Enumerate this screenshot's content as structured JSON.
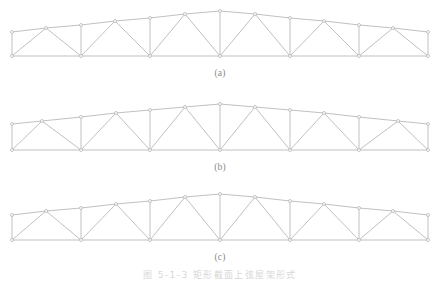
{
  "page": {
    "background_color": "#ffffff",
    "line_color": "#b9b9b9",
    "node_color": "#ffffff",
    "node_stroke_color": "#b0b0b0",
    "text_color": "#8a8a8a"
  },
  "figure": {
    "caption": "图 5-1-3  矩形截面上弦屋架形式",
    "caption_visible_fragment": "图 5-1-3  矩形截面上弦屋架形式",
    "subfigures": [
      {
        "id": "a",
        "label": "(a)",
        "description": "Low-pitch trapezoidal truss with 12 bottom-chord panels and alternating-direction web diagonals"
      },
      {
        "id": "b",
        "label": "(b)",
        "description": "Low-pitch truss with 8 bottom-chord panels, vertical posts at panel points and sloping web diagonals"
      },
      {
        "id": "c",
        "label": "(c)",
        "description": "Low-pitch truss with 8 bottom-chord panels, mirrored diagonal arrangement"
      }
    ]
  },
  "geometry": {
    "viewbox": {
      "width": 440,
      "height": 62
    },
    "truss_a": {
      "bottom_chord_y": 52,
      "eave_y": 28,
      "apex_y": 7,
      "left_x": 12,
      "right_x": 428,
      "bottom_nodes_x": [
        12,
        81,
        150,
        220,
        290,
        359,
        428
      ],
      "top_nodes": [
        [
          12,
          28
        ],
        [
          46,
          24
        ],
        [
          81,
          21
        ],
        [
          115,
          17
        ],
        [
          150,
          14
        ],
        [
          185,
          10
        ],
        [
          220,
          7
        ],
        [
          255,
          10
        ],
        [
          290,
          14
        ],
        [
          324,
          17
        ],
        [
          359,
          21
        ],
        [
          393,
          24
        ],
        [
          428,
          28
        ]
      ],
      "verticals": [
        [
          12,
          28,
          12,
          52
        ],
        [
          81,
          21,
          81,
          52
        ],
        [
          150,
          14,
          150,
          52
        ],
        [
          220,
          7,
          220,
          52
        ],
        [
          290,
          14,
          290,
          52
        ],
        [
          359,
          21,
          359,
          52
        ],
        [
          428,
          28,
          428,
          52
        ]
      ],
      "diagonals": [
        [
          12,
          52,
          46,
          24
        ],
        [
          46,
          24,
          81,
          52
        ],
        [
          81,
          52,
          115,
          17
        ],
        [
          115,
          17,
          150,
          52
        ],
        [
          150,
          52,
          185,
          10
        ],
        [
          185,
          10,
          220,
          52
        ],
        [
          220,
          52,
          255,
          10
        ],
        [
          255,
          10,
          290,
          52
        ],
        [
          290,
          52,
          324,
          17
        ],
        [
          324,
          17,
          359,
          52
        ],
        [
          359,
          52,
          393,
          24
        ],
        [
          393,
          24,
          428,
          52
        ]
      ]
    },
    "truss_b": {
      "bottom_chord_y": 52,
      "eave_y": 26,
      "apex_y": 6,
      "left_x": 12,
      "right_x": 428,
      "bottom_nodes_x": [
        12,
        81,
        150,
        220,
        290,
        359,
        428
      ],
      "top_nodes": [
        [
          12,
          26
        ],
        [
          42,
          23
        ],
        [
          81,
          19
        ],
        [
          116,
          15
        ],
        [
          150,
          12
        ],
        [
          185,
          9
        ],
        [
          220,
          6
        ],
        [
          255,
          9
        ],
        [
          290,
          12
        ],
        [
          324,
          15
        ],
        [
          359,
          19
        ],
        [
          398,
          23
        ],
        [
          428,
          26
        ]
      ],
      "verticals": [
        [
          12,
          26,
          12,
          52
        ],
        [
          81,
          19,
          81,
          52
        ],
        [
          150,
          12,
          150,
          52
        ],
        [
          220,
          6,
          220,
          52
        ],
        [
          290,
          12,
          290,
          52
        ],
        [
          359,
          19,
          359,
          52
        ],
        [
          428,
          26,
          428,
          52
        ]
      ],
      "diagonals": [
        [
          12,
          52,
          42,
          23
        ],
        [
          42,
          23,
          81,
          52
        ],
        [
          81,
          52,
          116,
          15
        ],
        [
          116,
          15,
          150,
          52
        ],
        [
          150,
          52,
          185,
          9
        ],
        [
          185,
          9,
          220,
          52
        ],
        [
          220,
          52,
          255,
          9
        ],
        [
          255,
          9,
          290,
          52
        ],
        [
          290,
          52,
          324,
          15
        ],
        [
          324,
          15,
          359,
          52
        ],
        [
          359,
          52,
          398,
          23
        ],
        [
          398,
          23,
          428,
          52
        ]
      ]
    },
    "truss_c": {
      "bottom_chord_y": 52,
      "eave_y": 27,
      "apex_y": 6,
      "left_x": 12,
      "right_x": 428,
      "bottom_nodes_x": [
        12,
        81,
        150,
        220,
        290,
        359,
        428
      ],
      "top_nodes": [
        [
          12,
          27
        ],
        [
          46,
          23
        ],
        [
          81,
          20
        ],
        [
          116,
          16
        ],
        [
          150,
          13
        ],
        [
          185,
          9
        ],
        [
          220,
          6
        ],
        [
          255,
          9
        ],
        [
          290,
          13
        ],
        [
          324,
          16
        ],
        [
          359,
          20
        ],
        [
          393,
          23
        ],
        [
          428,
          27
        ]
      ],
      "verticals": [
        [
          12,
          27,
          12,
          52
        ],
        [
          81,
          20,
          81,
          52
        ],
        [
          150,
          13,
          150,
          52
        ],
        [
          220,
          6,
          220,
          52
        ],
        [
          290,
          13,
          290,
          52
        ],
        [
          359,
          20,
          359,
          52
        ],
        [
          428,
          27,
          428,
          52
        ]
      ],
      "diagonals": [
        [
          12,
          52,
          46,
          23
        ],
        [
          46,
          23,
          81,
          52
        ],
        [
          81,
          52,
          116,
          16
        ],
        [
          116,
          16,
          150,
          52
        ],
        [
          150,
          52,
          185,
          9
        ],
        [
          185,
          9,
          220,
          52
        ],
        [
          220,
          52,
          255,
          9
        ],
        [
          255,
          9,
          290,
          52
        ],
        [
          290,
          52,
          324,
          16
        ],
        [
          324,
          16,
          359,
          52
        ],
        [
          359,
          52,
          393,
          23
        ],
        [
          393,
          23,
          428,
          52
        ]
      ]
    }
  }
}
